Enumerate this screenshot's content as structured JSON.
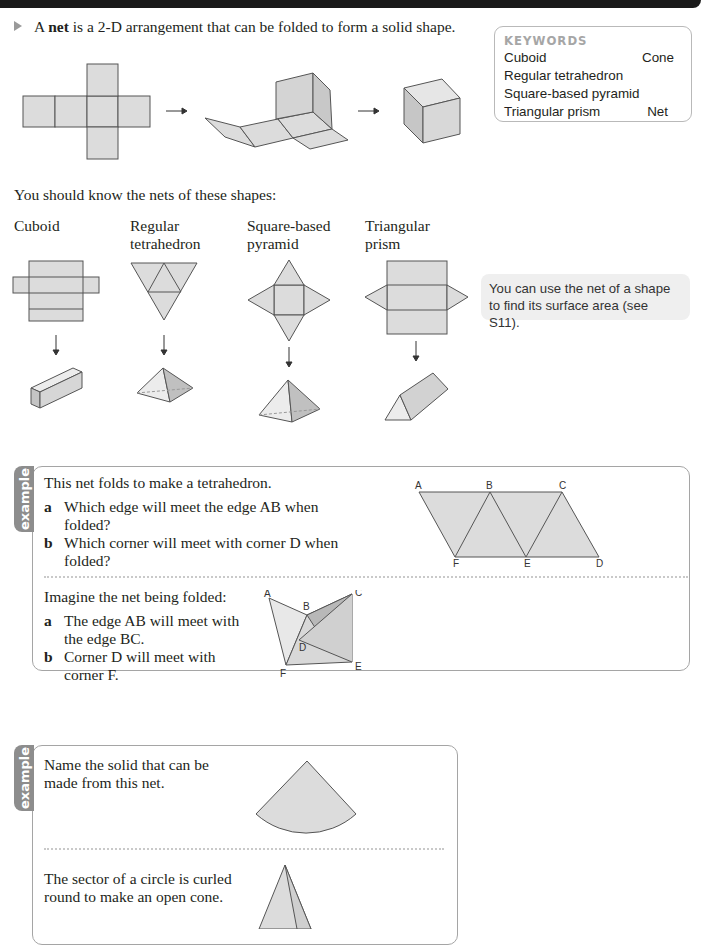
{
  "intro": {
    "prefix": "A ",
    "term": "net",
    "suffix": " is a 2-D arrangement that can be folded to form a solid shape."
  },
  "keywords": {
    "title": "KEYWORDS",
    "rows": [
      {
        "left": "Cuboid",
        "right": "Cone"
      },
      {
        "left": "Regular tetrahedron",
        "right": ""
      },
      {
        "left": "Square-based pyramid",
        "right": ""
      },
      {
        "left": "Triangular prism",
        "right": "Net"
      }
    ]
  },
  "arrows": {
    "right": "→",
    "down": "↓"
  },
  "nets_intro": "You should know the nets of these shapes:",
  "shapes": [
    {
      "line1": "Cuboid",
      "line2": ""
    },
    {
      "line1": "Regular",
      "line2": "tetrahedron"
    },
    {
      "line1": "Square-based",
      "line2": "pyramid"
    },
    {
      "line1": "Triangular",
      "line2": "prism"
    }
  ],
  "note": "You can use the net of a shape to find its surface area (see S11).",
  "example1": {
    "tab": "example",
    "question": "This net folds to make a tetrahedron.",
    "parts": [
      {
        "label": "a",
        "text": "Which edge will meet the edge AB when folded?"
      },
      {
        "label": "b",
        "text": "Which corner will meet with corner D when folded?"
      }
    ],
    "net_labels": {
      "A": "A",
      "B": "B",
      "C": "C",
      "D": "D",
      "E": "E",
      "F": "F"
    },
    "solution_intro": "Imagine the net being folded:",
    "answers": [
      {
        "label": "a",
        "line1": "The edge AB will meet with",
        "line2": "the edge BC."
      },
      {
        "label": "b",
        "line1": "Corner D will meet with",
        "line2": "corner F."
      }
    ]
  },
  "example2": {
    "tab": "example",
    "question_line1": "Name the solid that can be",
    "question_line2": "made from this net.",
    "answer_line1": "The sector of a circle is curled",
    "answer_line2": "round to make an open cone."
  },
  "colors": {
    "fill": "#dcdcdc",
    "fill_dark": "#bdbdbd",
    "stroke": "#555555",
    "tab": "#8d8d8d",
    "note_bg": "#efefef"
  }
}
